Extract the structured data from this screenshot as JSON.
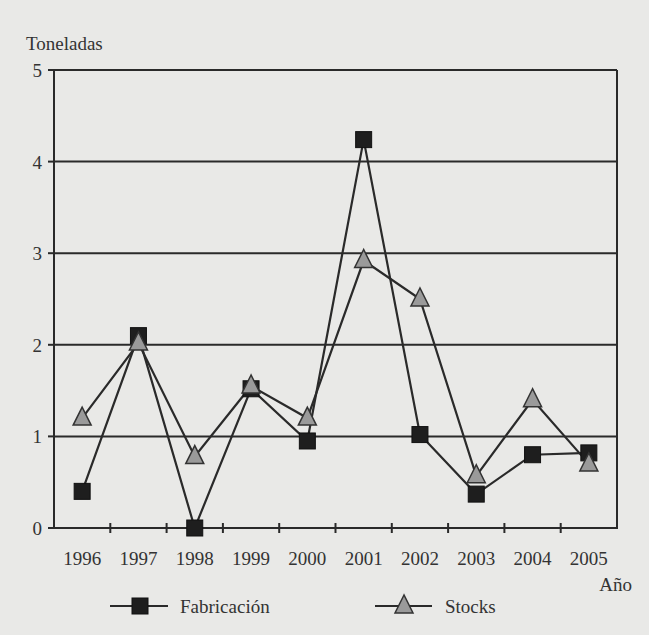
{
  "chart_data": {
    "type": "line",
    "title": "",
    "ylabel": "Toneladas",
    "xlabel": "Año",
    "ylim": [
      0,
      5
    ],
    "yticks": [
      0,
      1,
      2,
      3,
      4,
      5
    ],
    "grid": "horizontal",
    "legend_position": "bottom",
    "categories": [
      "1996",
      "1997",
      "1998",
      "1999",
      "2000",
      "2001",
      "2002",
      "2003",
      "2004",
      "2005"
    ],
    "series": [
      {
        "name": "Fabricación",
        "marker": "square",
        "color": "#1e1e1e",
        "values": [
          0.4,
          2.1,
          0.0,
          1.52,
          0.95,
          4.24,
          1.02,
          0.37,
          0.8,
          0.82
        ]
      },
      {
        "name": "Stocks",
        "marker": "triangle",
        "color": "#9a9a9a",
        "values": [
          1.2,
          2.02,
          0.78,
          1.55,
          1.2,
          2.92,
          2.5,
          0.57,
          1.4,
          0.7
        ]
      }
    ]
  },
  "colors": {
    "background": "#e9e9e7",
    "axis": "#2a2a2a",
    "grid": "#2a2a2a",
    "line": "#2a2a2a",
    "square_fill": "#1e1e1e",
    "triangle_fill": "#9a9a9a"
  }
}
